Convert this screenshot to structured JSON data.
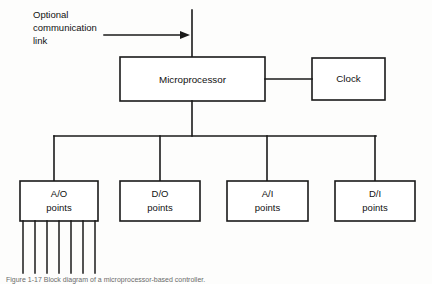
{
  "figure": {
    "background_color": "#fdfdfc",
    "line_color": "#1a1a1a",
    "box_fill": "#ffffff"
  },
  "annotation": {
    "line1": "Optional",
    "line2": "communication",
    "line3": "link",
    "arrow_direction": "right"
  },
  "blocks": {
    "microprocessor": {
      "label": "Microprocessor"
    },
    "clock": {
      "label": "Clock"
    },
    "analog_output": {
      "line1": "A/O",
      "line2": "points"
    },
    "digital_output": {
      "line1": "D/O",
      "line2": "points"
    },
    "analog_input": {
      "line1": "A/I",
      "line2": "points"
    },
    "digital_input": {
      "line1": "D/I",
      "line2": "points"
    }
  },
  "connections": {
    "comm_link_bus": "vertical trunk into microprocessor top",
    "micro_to_clock": "horizontal link",
    "micro_to_bus": "vertical drop to distribution bus",
    "bus": "horizontal distribution bus to four point blocks",
    "ao_output_lines_count": 7
  },
  "caption": {
    "text": "Figure 1-17   Block diagram of a microprocessor-based controller."
  }
}
